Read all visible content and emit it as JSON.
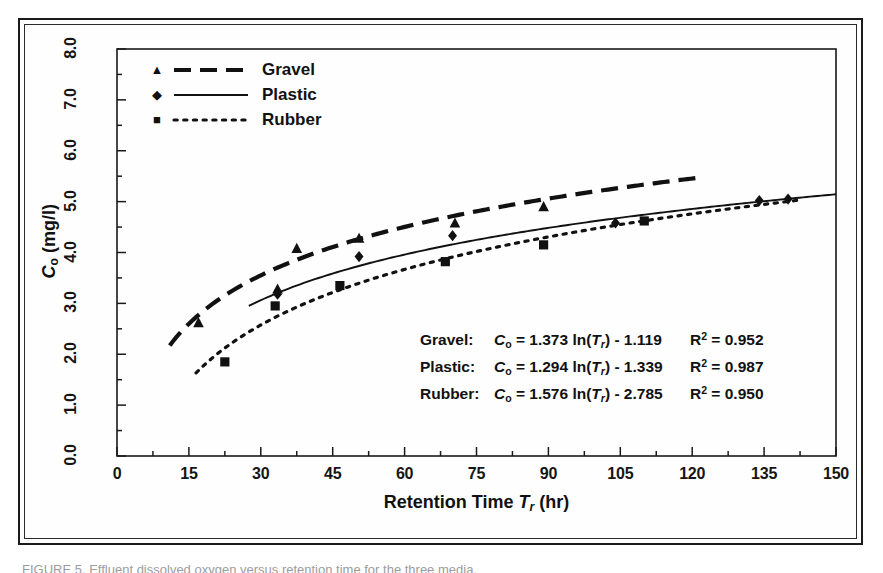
{
  "figure": {
    "caption_partial": "FIGURE 5. Effluent dissolved oxygen versus retention time for the three media."
  },
  "chart_data": {
    "type": "scatter",
    "title": "",
    "xlabel": "Retention Time T_r (hr)",
    "ylabel": "C_o (mg/l)",
    "xlim": [
      0,
      150
    ],
    "ylim": [
      0.0,
      8.0
    ],
    "x_major_step": 15,
    "x_minor_step": 7.5,
    "y_major_step": 1.0,
    "y_minor_step": 0.5,
    "grid": false,
    "legend_position": "top-left",
    "x_ticks": [
      "0",
      "15",
      "30",
      "45",
      "60",
      "75",
      "90",
      "105",
      "120",
      "135",
      "150"
    ],
    "y_ticks": [
      "0.0",
      "1.0",
      "2.0",
      "3.0",
      "4.0",
      "5.0",
      "6.0",
      "7.0",
      "8.0"
    ],
    "series": [
      {
        "name": "Gravel",
        "marker": "triangle",
        "linestyle": "dashed",
        "color": "#111111",
        "fit_type": "logarithmic",
        "fit_slope": 1.373,
        "fit_intercept": -1.119,
        "r_squared": 0.952,
        "points": [
          {
            "x": 17.0,
            "y": 2.62
          },
          {
            "x": 33.5,
            "y": 3.28
          },
          {
            "x": 37.5,
            "y": 4.08
          },
          {
            "x": 50.5,
            "y": 4.28
          },
          {
            "x": 70.5,
            "y": 4.58
          },
          {
            "x": 89.0,
            "y": 4.9
          }
        ]
      },
      {
        "name": "Plastic",
        "marker": "diamond",
        "linestyle": "solid",
        "color": "#111111",
        "fit_type": "logarithmic",
        "fit_slope": 1.294,
        "fit_intercept": -1.339,
        "r_squared": 0.987,
        "points": [
          {
            "x": 33.5,
            "y": 3.18
          },
          {
            "x": 50.5,
            "y": 3.92
          },
          {
            "x": 70.0,
            "y": 4.33
          },
          {
            "x": 104.0,
            "y": 4.58
          },
          {
            "x": 134.0,
            "y": 5.02
          },
          {
            "x": 140.0,
            "y": 5.05
          }
        ]
      },
      {
        "name": "Rubber",
        "marker": "square",
        "linestyle": "dotted",
        "color": "#111111",
        "fit_type": "logarithmic",
        "fit_slope": 1.576,
        "fit_intercept": -2.785,
        "r_squared": 0.95,
        "points": [
          {
            "x": 22.5,
            "y": 1.85
          },
          {
            "x": 33.0,
            "y": 2.95
          },
          {
            "x": 46.5,
            "y": 3.35
          },
          {
            "x": 68.5,
            "y": 3.82
          },
          {
            "x": 89.0,
            "y": 4.15
          },
          {
            "x": 110.0,
            "y": 4.62
          }
        ]
      }
    ]
  },
  "axes": {
    "x_title_pre": "Retention Time ",
    "x_title_var": "T",
    "x_title_sub": "r",
    "x_title_post": " (hr)",
    "y_title_var": "C",
    "y_title_sub": "o",
    "y_title_post": " (mg/l)"
  },
  "legend": {
    "items": [
      {
        "label": "Gravel",
        "marker": "triangle-marker",
        "style": "dashed"
      },
      {
        "label": "Plastic",
        "marker": "diamond-marker",
        "style": "solid"
      },
      {
        "label": "Rubber",
        "marker": "square-marker",
        "style": "dotted"
      }
    ]
  },
  "equations": {
    "rows": [
      {
        "name": "Gravel:",
        "lhs_var": "C",
        "lhs_sub": "o",
        "eq_mid": " = 1.373 ln(",
        "fn_var": "T",
        "fn_sub": "r",
        "eq_tail": ") - 1.119",
        "r2_label": "R",
        "r2_sup": "2",
        "r2_value": " = 0.952"
      },
      {
        "name": "Plastic:",
        "lhs_var": "C",
        "lhs_sub": "o",
        "eq_mid": " = 1.294 ln(",
        "fn_var": "T",
        "fn_sub": "r",
        "eq_tail": ") - 1.339",
        "r2_label": "R",
        "r2_sup": "2",
        "r2_value": " = 0.987"
      },
      {
        "name": "Rubber:",
        "lhs_var": "C",
        "lhs_sub": "o",
        "eq_mid": " = 1.576 ln(",
        "fn_var": "T",
        "fn_sub": "r",
        "eq_tail": ") - 2.785",
        "r2_label": "R",
        "r2_sup": "2",
        "r2_value": " = 0.950"
      }
    ]
  }
}
